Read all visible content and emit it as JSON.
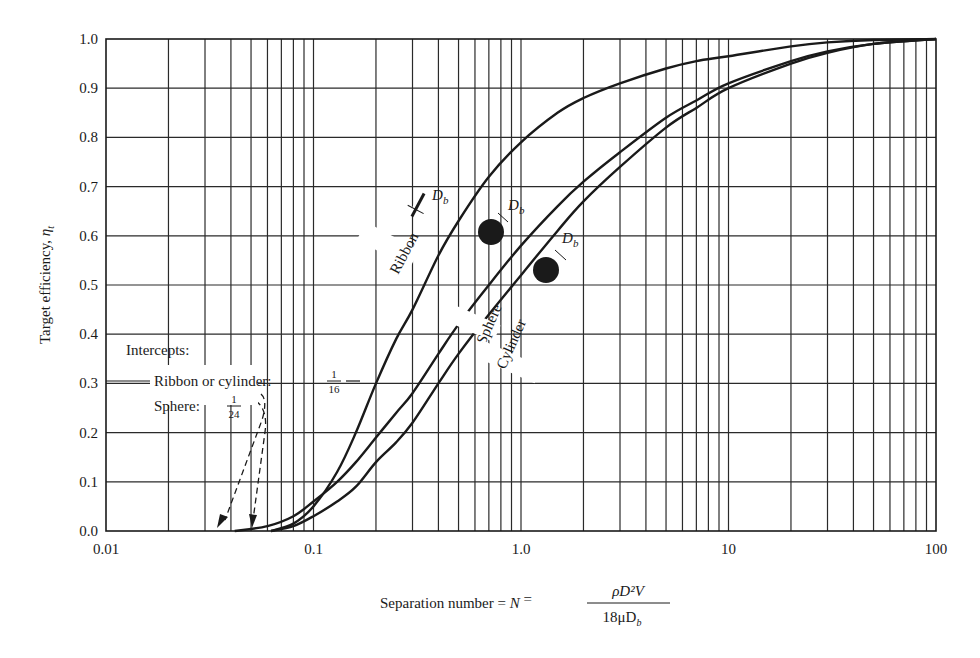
{
  "chart_data": {
    "type": "line",
    "title": "",
    "xlabel": "Separation number = N_s = ρD²V / (18μD_b)",
    "xlabel_parts": {
      "prefix": "Separation number = ",
      "symbol": "N",
      "symbol_sub": "s",
      "equals": " = ",
      "numerator": "ρD²V",
      "denominator": "18μD",
      "denominator_sub": "b"
    },
    "ylabel": "Target efficiency, η_t",
    "ylabel_parts": {
      "text": "Target efficiency, ",
      "symbol": "η",
      "sub": "t"
    },
    "xscale": "log",
    "xlim": [
      0.01,
      100
    ],
    "ylim": [
      0.0,
      1.0
    ],
    "grid": true,
    "x_ticks": [
      {
        "value": 0.01,
        "label": "0.01"
      },
      {
        "value": 0.1,
        "label": "0.1"
      },
      {
        "value": 1,
        "label": "1.0"
      },
      {
        "value": 10,
        "label": "10"
      },
      {
        "value": 100,
        "label": "100"
      }
    ],
    "y_ticks": [
      {
        "value": 0.0,
        "label": "0.0"
      },
      {
        "value": 0.1,
        "label": "0.1"
      },
      {
        "value": 0.2,
        "label": "0.2"
      },
      {
        "value": 0.3,
        "label": "0.3"
      },
      {
        "value": 0.4,
        "label": "0.4"
      },
      {
        "value": 0.5,
        "label": "0.5"
      },
      {
        "value": 0.6,
        "label": "0.6"
      },
      {
        "value": 0.7,
        "label": "0.7"
      },
      {
        "value": 0.8,
        "label": "0.8"
      },
      {
        "value": 0.9,
        "label": "0.9"
      },
      {
        "value": 1.0,
        "label": "1.0"
      }
    ],
    "series": [
      {
        "name": "Ribbon",
        "x": [
          0.0625,
          0.08,
          0.1,
          0.13,
          0.16,
          0.2,
          0.25,
          0.3,
          0.4,
          0.5,
          0.7,
          1.0,
          1.5,
          2,
          3,
          5,
          7,
          10,
          20,
          30,
          50,
          100
        ],
        "y": [
          0.0,
          0.015,
          0.05,
          0.12,
          0.2,
          0.3,
          0.39,
          0.45,
          0.56,
          0.63,
          0.72,
          0.79,
          0.85,
          0.88,
          0.91,
          0.94,
          0.955,
          0.965,
          0.985,
          0.993,
          0.998,
          1.0
        ]
      },
      {
        "name": "Sphere",
        "x": [
          0.0417,
          0.06,
          0.08,
          0.1,
          0.13,
          0.16,
          0.2,
          0.25,
          0.3,
          0.4,
          0.5,
          0.7,
          1.0,
          1.5,
          2,
          3,
          5,
          7,
          10,
          20,
          30,
          50,
          100
        ],
        "y": [
          0.0,
          0.01,
          0.03,
          0.06,
          0.1,
          0.14,
          0.19,
          0.24,
          0.28,
          0.36,
          0.42,
          0.5,
          0.58,
          0.66,
          0.71,
          0.77,
          0.84,
          0.875,
          0.91,
          0.955,
          0.975,
          0.99,
          1.0
        ]
      },
      {
        "name": "Cylinder",
        "x": [
          0.0625,
          0.08,
          0.1,
          0.13,
          0.16,
          0.2,
          0.25,
          0.3,
          0.4,
          0.5,
          0.7,
          1.0,
          1.5,
          2,
          3,
          5,
          7,
          10,
          20,
          30,
          50,
          100
        ],
        "y": [
          0.0,
          0.01,
          0.03,
          0.06,
          0.09,
          0.14,
          0.18,
          0.22,
          0.3,
          0.36,
          0.44,
          0.52,
          0.61,
          0.67,
          0.74,
          0.82,
          0.86,
          0.9,
          0.95,
          0.972,
          0.99,
          1.0
        ]
      }
    ],
    "curve_labels": [
      {
        "series": "Ribbon",
        "text": "Ribbon",
        "dimension": "D",
        "dimension_sub": "b"
      },
      {
        "series": "Sphere",
        "text": "Sphere",
        "dimension": "D",
        "dimension_sub": "b"
      },
      {
        "series": "Cylinder",
        "text": "Cylinder",
        "dimension": "D",
        "dimension_sub": "b"
      }
    ],
    "annotations": {
      "heading": "Intercepts:",
      "ribbon_cylinder": {
        "label": "Ribbon or cylinder: ",
        "num": "1",
        "den": "16",
        "x_value": 0.0625
      },
      "sphere": {
        "label": "Sphere: ",
        "num": "1",
        "den": "24",
        "x_value": 0.0417
      }
    },
    "legend": "none (inline curve labels)"
  }
}
